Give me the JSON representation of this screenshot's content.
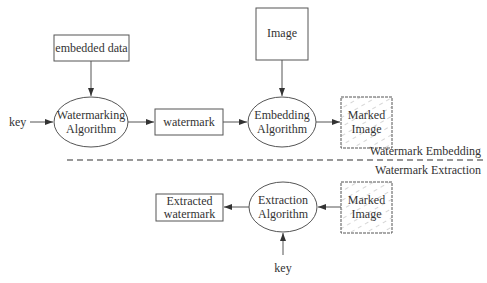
{
  "diagram": {
    "embedding": {
      "embedded_data": "embedded data",
      "key": "key",
      "watermarking_algorithm": [
        "Watermarking",
        "Algorithm"
      ],
      "watermark": "watermark",
      "image": "Image",
      "embedding_algorithm": [
        "Embedding",
        "Algorithm"
      ],
      "marked_image": [
        "Marked",
        "Image"
      ]
    },
    "separator": {
      "upper_label": "Watermark Embedding",
      "lower_label": "Watermark Extraction"
    },
    "extraction": {
      "extracted_watermark": [
        "Extracted",
        "watermark"
      ],
      "extraction_algorithm": [
        "Extraction",
        "Algorithm"
      ],
      "marked_image": [
        "Marked",
        "Image"
      ],
      "key": "key"
    },
    "colors": {
      "stroke": "#555555",
      "text": "#333333",
      "hatch": "#999999"
    }
  }
}
